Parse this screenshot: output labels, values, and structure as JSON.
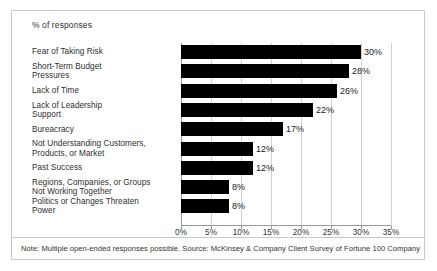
{
  "chart_data": {
    "type": "bar",
    "orientation": "horizontal",
    "title": "% of responses",
    "xlabel": "",
    "ylabel": "",
    "xlim": [
      0,
      35
    ],
    "grid": true,
    "legend": null,
    "categories": [
      "Fear of Taking Risk",
      "Short-Term Budget Pressures",
      "Lack of Time",
      "Lack of Leadership Support",
      "Bureacracy",
      "Not Understanding Customers, Products, or Market",
      "Past Success",
      "Regions, Companies, or Groups Not Working Together",
      "Politics or Changes Threaten Power"
    ],
    "category_lines": [
      [
        "Fear of Taking Risk"
      ],
      [
        "Short-Term Budget",
        "Pressures"
      ],
      [
        "Lack of Time"
      ],
      [
        "Lack of Leadership",
        "Support"
      ],
      [
        "Bureacracy"
      ],
      [
        "Not Understanding Customers,",
        "Products, or Market"
      ],
      [
        "Past Success"
      ],
      [
        "Regions, Companies, or Groups",
        "Not Working Together"
      ],
      [
        "Politics or Changes Threaten",
        "Power"
      ]
    ],
    "values": [
      30,
      28,
      26,
      22,
      17,
      12,
      12,
      8,
      8
    ],
    "value_labels": [
      "30%",
      "28%",
      "26%",
      "22%",
      "17%",
      "12%",
      "12%",
      "8%",
      "8%"
    ],
    "xticks": [
      0,
      5,
      10,
      15,
      20,
      25,
      30,
      35
    ],
    "xtick_labels": [
      "0%",
      "5%",
      "10%",
      "15%",
      "20%",
      "25%",
      "30%",
      "35%"
    ],
    "bar_color": "#000000",
    "grid_color": "#d2d2d2",
    "axis_color": "#9a9a9a"
  },
  "note": {
    "text": "Note: Multiple open-ended responses possible. Source: McKinsey & Company Client Survey of Fortune 100 Company"
  }
}
